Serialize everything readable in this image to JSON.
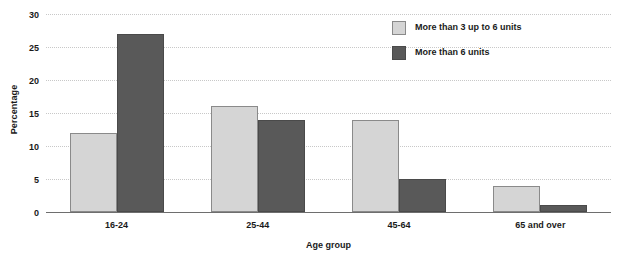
{
  "chart_data": {
    "type": "bar",
    "title": "",
    "xlabel": "Age group",
    "ylabel": "Percentage",
    "categories": [
      "16-24",
      "25-44",
      "45-64",
      "65 and over"
    ],
    "series": [
      {
        "name": "More than 3 up to 6 units",
        "color": "#d5d5d5",
        "values": [
          12,
          16,
          14,
          4
        ]
      },
      {
        "name": "More than 6 units",
        "color": "#595959",
        "values": [
          27,
          14,
          5,
          1
        ]
      }
    ],
    "ylim": [
      0,
      30
    ],
    "yticks": [
      0,
      5,
      10,
      15,
      20,
      25,
      30
    ],
    "ytick_labels": [
      "0",
      "5",
      "10",
      "15",
      "20",
      "25",
      "30"
    ],
    "grid": true,
    "legend_position": "top-right"
  }
}
